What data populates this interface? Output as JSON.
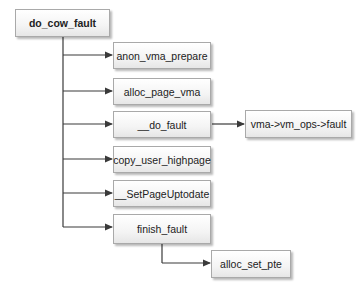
{
  "diagram": {
    "root": {
      "label": "do_cow_fault"
    },
    "children": [
      {
        "label": "anon_vma_prepare"
      },
      {
        "label": "alloc_page_vma"
      },
      {
        "label": "__do_fault",
        "child": {
          "label": "vma->vm_ops->fault"
        }
      },
      {
        "label": "copy_user_highpage"
      },
      {
        "label": "__SetPageUptodate"
      },
      {
        "label": "finish_fault",
        "child": {
          "label": "alloc_set_pte"
        }
      }
    ],
    "colors": {
      "line": "#3a3a3a",
      "box_border": "#a9a9a9",
      "box_fill": "#f2f2f2"
    }
  }
}
